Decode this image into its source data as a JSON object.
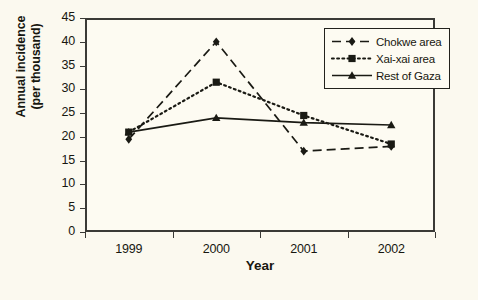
{
  "chart_data": {
    "type": "line",
    "title": "",
    "xlabel": "Year",
    "ylabel": "Annual incidence (per thousand)",
    "ylabel_line1": "Annual incidence",
    "ylabel_line2": "(per thousand)",
    "categories": [
      "1999",
      "2000",
      "2001",
      "2002"
    ],
    "x": [
      1999,
      2000,
      2001,
      2002
    ],
    "ylim": [
      0,
      45
    ],
    "ytick_values": [
      0,
      5,
      10,
      15,
      20,
      25,
      30,
      35,
      40,
      45
    ],
    "ytick_labels": [
      "0",
      "5",
      "10",
      "15",
      "20",
      "25",
      "30",
      "35",
      "40",
      "45"
    ],
    "grid": false,
    "legend_position": "top-right",
    "series": [
      {
        "name": "Chokwe area",
        "values": [
          19.5,
          40,
          17,
          18
        ],
        "marker": "diamond",
        "line_style": "dashed",
        "color": "#1a1a14"
      },
      {
        "name": "Xai-xai area",
        "values": [
          21,
          31.5,
          24.5,
          18.5
        ],
        "marker": "square",
        "line_style": "dotted",
        "color": "#1a1a14"
      },
      {
        "name": "Rest of Gaza",
        "values": [
          21,
          24,
          23,
          22.5
        ],
        "marker": "triangle",
        "line_style": "solid",
        "color": "#1a1a14"
      }
    ]
  },
  "figure": {
    "background_color": "#fbf9ef",
    "plot_background_color": "#fdfbf2",
    "axis_color": "#3a3a36",
    "text_color": "#17170f"
  }
}
